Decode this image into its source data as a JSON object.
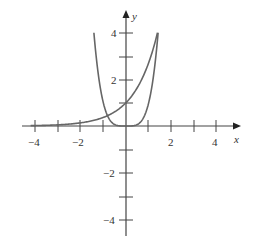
{
  "chart_data": {
    "type": "line",
    "title": "",
    "xlabel": "x",
    "ylabel": "y",
    "xlim": [
      -4.5,
      4.8
    ],
    "ylim": [
      -4.7,
      4.9
    ],
    "grid": false,
    "x_ticks": [
      -4,
      -3,
      -2,
      -1,
      1,
      2,
      3,
      4
    ],
    "x_tick_labels": [
      "-4",
      "-2",
      "2",
      "4"
    ],
    "y_ticks": [
      -4,
      -3,
      -2,
      -1,
      1,
      2,
      3,
      4
    ],
    "y_tick_labels": [
      "4",
      "2",
      "-2",
      "-4"
    ],
    "series": [
      {
        "name": "y = e^x",
        "x": [
          -4,
          -3,
          -2,
          -1,
          0,
          1,
          1.39
        ],
        "y": [
          0.02,
          0.05,
          0.14,
          0.37,
          1,
          2.72,
          4
        ]
      },
      {
        "name": "y = x^4",
        "x": [
          -1.41,
          -1,
          -0.5,
          0,
          0.5,
          1,
          1.41
        ],
        "y": [
          4,
          1,
          0.06,
          0,
          0.06,
          1,
          4
        ]
      }
    ]
  },
  "labels": {
    "x_axis": "x",
    "y_axis": "y",
    "xt_m4": "−4",
    "xt_m2": "−2",
    "xt_2": "2",
    "xt_4": "4",
    "yt_4": "4",
    "yt_2": "2",
    "yt_m2": "−2",
    "yt_m4": "−4"
  }
}
